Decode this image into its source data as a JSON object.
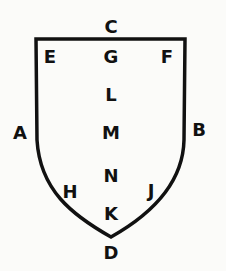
{
  "diagram": {
    "shape": "shield",
    "stroke_color": "#111111",
    "labels": [
      {
        "id": "C",
        "text": "C",
        "x": 111,
        "y": 27
      },
      {
        "id": "E",
        "text": "E",
        "x": 50,
        "y": 57
      },
      {
        "id": "G",
        "text": "G",
        "x": 111,
        "y": 57
      },
      {
        "id": "F",
        "text": "F",
        "x": 167,
        "y": 57
      },
      {
        "id": "L",
        "text": "L",
        "x": 111,
        "y": 95
      },
      {
        "id": "A",
        "text": "A",
        "x": 20,
        "y": 133
      },
      {
        "id": "M",
        "text": "M",
        "x": 111,
        "y": 133
      },
      {
        "id": "B",
        "text": "B",
        "x": 199,
        "y": 130
      },
      {
        "id": "N",
        "text": "N",
        "x": 111,
        "y": 176
      },
      {
        "id": "H",
        "text": "H",
        "x": 70,
        "y": 192
      },
      {
        "id": "J",
        "text": "J",
        "x": 151,
        "y": 191
      },
      {
        "id": "K",
        "text": "K",
        "x": 111,
        "y": 214
      },
      {
        "id": "D",
        "text": "D",
        "x": 111,
        "y": 253
      }
    ]
  }
}
